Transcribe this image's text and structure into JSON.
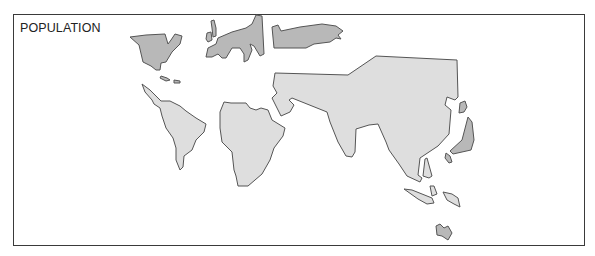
{
  "map": {
    "title": "POPULATION",
    "type": "cartogram",
    "colors": {
      "high_population_region": "#dedede",
      "low_population_region": "#b8b8b8",
      "outline": "#555555",
      "frame": "#3a3a3a"
    },
    "regions": [
      {
        "name": "North America",
        "shade": "dark"
      },
      {
        "name": "Caribbean",
        "shade": "dark"
      },
      {
        "name": "Greenland/Iceland",
        "shade": "dark"
      },
      {
        "name": "Europe",
        "shade": "dark"
      },
      {
        "name": "Russia",
        "shade": "dark"
      },
      {
        "name": "South America",
        "shade": "light"
      },
      {
        "name": "Africa",
        "shade": "light"
      },
      {
        "name": "Asia",
        "shade": "light"
      },
      {
        "name": "Japan",
        "shade": "dark"
      },
      {
        "name": "Philippines",
        "shade": "light"
      },
      {
        "name": "Indonesia",
        "shade": "light"
      },
      {
        "name": "Australia",
        "shade": "dark"
      }
    ]
  }
}
